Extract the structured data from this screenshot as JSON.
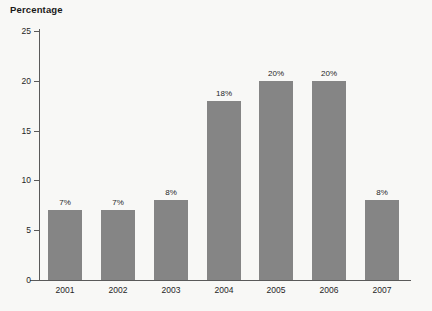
{
  "chart_data": {
    "type": "bar",
    "title": "Percentage",
    "xlabel": "",
    "ylabel": "",
    "categories": [
      "2001",
      "2002",
      "2003",
      "2004",
      "2005",
      "2006",
      "2007"
    ],
    "values": [
      7,
      7,
      8,
      18,
      20,
      20,
      8
    ],
    "data_labels": [
      "7%",
      "7%",
      "8%",
      "18%",
      "20%",
      "20%",
      "8%"
    ],
    "ylim": [
      0,
      25
    ],
    "y_ticks": [
      0,
      5,
      10,
      15,
      20,
      25
    ],
    "y_tick_labels": [
      "0",
      "5",
      "10",
      "15",
      "20",
      "25"
    ],
    "grid": false,
    "legend": null,
    "bar_color": "#858585",
    "axis_color": "#5a5a5a",
    "text_color": "#262626",
    "background_color": "#f8f8f6"
  }
}
